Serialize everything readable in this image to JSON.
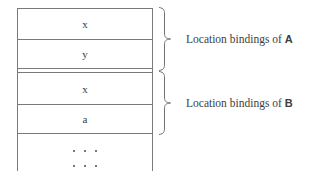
{
  "figure": {
    "stack": {
      "name": "runtime-stack",
      "cells": [
        {
          "id": "cell-1",
          "label": "x",
          "group": "A"
        },
        {
          "id": "cell-2",
          "label": "y",
          "group": "A"
        },
        {
          "id": "cell-3",
          "label": "x",
          "group": "B"
        },
        {
          "id": "cell-4",
          "label": "a",
          "group": "B"
        }
      ],
      "continuation": {
        "name": "ellipsis",
        "rows": [
          {
            "id": "ellipsis-row-1",
            "text": ". . ."
          },
          {
            "id": "ellipsis-row-2",
            "text": ". . ."
          }
        ]
      }
    },
    "annotations": [
      {
        "id": "annotation-a",
        "prefix": "Location bindings of ",
        "target": "A"
      },
      {
        "id": "annotation-b",
        "prefix": "Location bindings of ",
        "target": "B"
      }
    ],
    "colors": {
      "stroke": "#7a7a7a",
      "brace": "#6f6f6f",
      "text": "#3d3d3d",
      "background": "#ffffff"
    }
  }
}
